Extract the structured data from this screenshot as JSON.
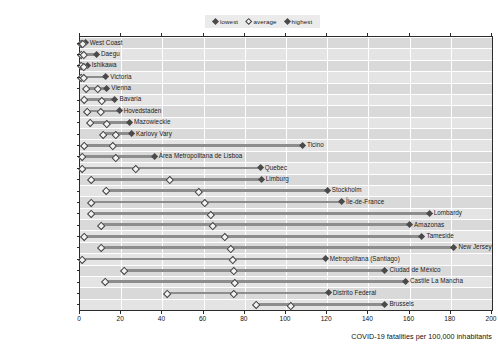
{
  "legend": {
    "position": "top-right",
    "items": [
      {
        "key": "lowest",
        "label": "lowest",
        "style": "filled-diamond"
      },
      {
        "key": "average",
        "label": "average",
        "style": "open-diamond"
      },
      {
        "key": "highest",
        "label": "highest",
        "style": "filled-diamond"
      }
    ]
  },
  "axis": {
    "x_title": "COVID-19 fatalities per 100,000 inhabitants",
    "x_ticks": [
      "0",
      "20",
      "40",
      "60",
      "80",
      "100",
      "120",
      "140",
      "160",
      "180",
      "200"
    ]
  },
  "chart_data": {
    "type": "bar",
    "title": "",
    "subtitle": "",
    "xlabel": "COVID-19 fatalities per 100,000 inhabitants",
    "ylabel": "",
    "xlim": [
      0,
      200
    ],
    "xticks": [
      0,
      20,
      40,
      60,
      80,
      100,
      120,
      140,
      160,
      180,
      200
    ],
    "grid": "vertical",
    "legend_position": "top-right",
    "series": [
      {
        "name": "lowest",
        "marker": "filled-diamond"
      },
      {
        "name": "average",
        "marker": "open-diamond"
      },
      {
        "name": "highest",
        "marker": "filled-diamond"
      }
    ],
    "categories": [
      "New Zealand",
      "Korea",
      "Japan",
      "Australia",
      "Austria",
      "Germany",
      "Denmark",
      "Poland",
      "Czech Republic",
      "Switzerland",
      "Portugal",
      "Canada",
      "Netherlands",
      "Sweden",
      "France",
      "Italy",
      "Colombia",
      "United Kingdom",
      "United States",
      "Chile",
      "Mexico",
      "Spain",
      "Brazil",
      "Belgium"
    ],
    "rows": [
      {
        "country": "New Zealand",
        "lowest": 0.0,
        "average": 0.8,
        "highest": 2.5,
        "region": "West Coast"
      },
      {
        "country": "Korea",
        "lowest": 0.0,
        "average": 1.2,
        "highest": 8.0,
        "region": "Daegu"
      },
      {
        "country": "Japan",
        "lowest": 0.0,
        "average": 1.3,
        "highest": 3.5,
        "region": "Ishikawa"
      },
      {
        "country": "Australia",
        "lowest": 0.0,
        "average": 1.5,
        "highest": 12.5,
        "region": "Victoria"
      },
      {
        "country": "Austria",
        "lowest": 2.5,
        "average": 8.0,
        "highest": 13.0,
        "region": "Vienna"
      },
      {
        "country": "Germany",
        "lowest": 1.5,
        "average": 10.0,
        "highest": 17.0,
        "region": "Bavaria"
      },
      {
        "country": "Denmark",
        "lowest": 3.0,
        "average": 9.5,
        "highest": 19.0,
        "region": "Hovedstaden"
      },
      {
        "country": "Poland",
        "lowest": 4.5,
        "average": 12.5,
        "highest": 24.0,
        "region": "Mazowieckie"
      },
      {
        "country": "Czech Republic",
        "lowest": 11.0,
        "average": 17.0,
        "highest": 25.0,
        "region": "Karlovy Vary"
      },
      {
        "country": "Switzerland",
        "lowest": 1.5,
        "average": 15.5,
        "highest": 108.0,
        "region": "Ticino"
      },
      {
        "country": "Portugal",
        "lowest": 0.5,
        "average": 17.0,
        "highest": 36.0,
        "region": "Área Metropolitana de Lisboa"
      },
      {
        "country": "Canada",
        "lowest": 0.5,
        "average": 26.5,
        "highest": 87.5,
        "region": "Quebec"
      },
      {
        "country": "Netherlands",
        "lowest": 5.0,
        "average": 43.0,
        "highest": 88.0,
        "region": "Limburg"
      },
      {
        "country": "Sweden",
        "lowest": 12.0,
        "average": 57.0,
        "highest": 120.0,
        "region": "Stockholm"
      },
      {
        "country": "France",
        "lowest": 5.0,
        "average": 60.0,
        "highest": 127.0,
        "region": "Île-de-France"
      },
      {
        "country": "Italy",
        "lowest": 5.0,
        "average": 63.0,
        "highest": 169.5,
        "region": "Lombardy"
      },
      {
        "country": "Colombia",
        "lowest": 10.0,
        "average": 64.0,
        "highest": 160.0,
        "region": "Amazonas"
      },
      {
        "country": "United Kingdom",
        "lowest": 1.5,
        "average": 70.0,
        "highest": 166.0,
        "region": "Tameside"
      },
      {
        "country": "United States",
        "lowest": 10.0,
        "average": 72.5,
        "highest": 181.5,
        "region": "New Jersey"
      },
      {
        "country": "Chile",
        "lowest": 0.5,
        "average": 73.5,
        "highest": 119.0,
        "region": "Metropolitana (Santiago)"
      },
      {
        "country": "Mexico",
        "lowest": 21.0,
        "average": 74.0,
        "highest": 148.0,
        "region": "Ciudad de México"
      },
      {
        "country": "Spain",
        "lowest": 11.5,
        "average": 74.5,
        "highest": 158.0,
        "region": "Castile La Mancha"
      },
      {
        "country": "Brazil",
        "lowest": 42.0,
        "average": 74.0,
        "highest": 120.5,
        "region": "Distrito Federal"
      },
      {
        "country": "Belgium",
        "lowest": 85.0,
        "average": 102.0,
        "highest": 148.0,
        "region": "Brussels"
      }
    ]
  }
}
